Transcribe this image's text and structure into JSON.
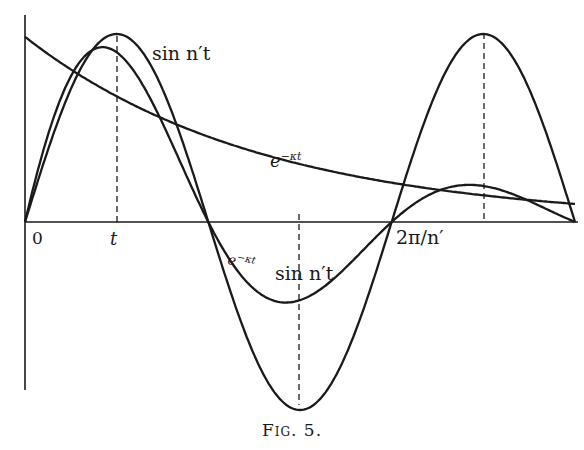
{
  "figure": {
    "caption": "Fig. 5.",
    "labels": {
      "sin_curve": "sin n′t",
      "exp_curve": "e",
      "exp_sup": "−κt",
      "damped_e": "e",
      "damped_sup": "−κt",
      "damped_sin": "sin n′t",
      "origin": "0",
      "t_tick": "t",
      "period_tick": "2π/n′"
    }
  },
  "chart_data": {
    "type": "line",
    "title": "Fig. 5.",
    "xlabel": "",
    "ylabel": "",
    "x_ticks": [
      "0",
      "t",
      "2π/n′"
    ],
    "grid": false,
    "series": [
      {
        "name": "sin n′t",
        "description": "pure sinusoid, 1.5 periods shown, amplitude 1"
      },
      {
        "name": "e^{−κt}",
        "description": "decaying exponential starting near 1"
      },
      {
        "name": "e^{−κt} sin n′t",
        "description": "damped sinusoid, product of the two"
      }
    ],
    "annotations": [
      "dashed verticals at peaks of sin n′t",
      "dashed vertical at t (first peak)"
    ]
  }
}
